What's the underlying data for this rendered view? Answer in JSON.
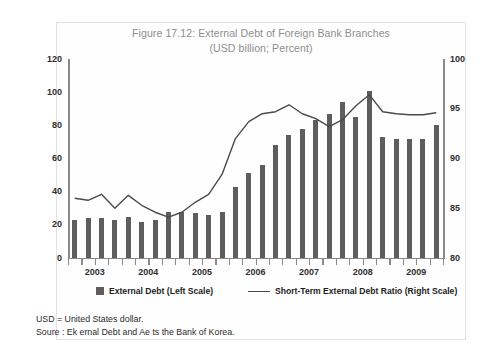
{
  "figure": {
    "title_line1": "Figure 17.12: External Debt of Foreign Bank Branches",
    "title_line2": "(USD billion; Percent)",
    "note_line1": "USD = United States dollar.",
    "note_line2": "Soure : Ek ernal Debt and Ae    ts  the Bank of Korea."
  },
  "legend": {
    "bar_label": "External Debt (Left Scale)",
    "line_label": "Short-Term External Debt Ratio (Right Scale)"
  },
  "colors": {
    "bar": "#5d5d5d",
    "line": "#4a4a4a",
    "axis": "#8a8a8a",
    "title": "#8d8d8d"
  },
  "chart_data": {
    "type": "bar",
    "title": "Figure 17.12: External Debt of Foreign Bank Branches",
    "subtitle": "(USD billion; Percent)",
    "xlabel": "",
    "ylabel": "USD billion",
    "y2label": "Percent",
    "ylim": [
      0,
      120
    ],
    "yticks": [
      0,
      20,
      40,
      60,
      80,
      100,
      120
    ],
    "y2lim": [
      80,
      100
    ],
    "y2ticks": [
      80,
      85,
      90,
      95,
      100
    ],
    "grid": false,
    "legend_position": "bottom",
    "categories": [
      "2003Q1",
      "2003Q2",
      "2003Q3",
      "2003Q4",
      "2004Q1",
      "2004Q2",
      "2004Q3",
      "2004Q4",
      "2005Q1",
      "2005Q2",
      "2005Q3",
      "2005Q4",
      "2006Q1",
      "2006Q2",
      "2006Q3",
      "2006Q4",
      "2007Q1",
      "2007Q2",
      "2007Q3",
      "2007Q4",
      "2008Q1",
      "2008Q2",
      "2008Q3",
      "2008Q4",
      "2009Q1",
      "2009Q2",
      "2009Q3",
      "2009Q4"
    ],
    "year_labels": [
      "2003",
      "2004",
      "2005",
      "2006",
      "2007",
      "2008",
      "2009"
    ],
    "series": [
      {
        "name": "External Debt (Left Scale)",
        "axis": "left",
        "type": "bar",
        "values": [
          23,
          24,
          24,
          23,
          25,
          22,
          23,
          28,
          28,
          27,
          26,
          28,
          43,
          51,
          56,
          68,
          74,
          78,
          83,
          87,
          94,
          85,
          101,
          73,
          72,
          72,
          72,
          80
        ]
      },
      {
        "name": "Short-Term External Debt Ratio (Right Scale)",
        "axis": "right",
        "type": "line",
        "values": [
          86.0,
          85.8,
          86.4,
          85.0,
          86.3,
          85.3,
          84.6,
          84.1,
          84.6,
          85.6,
          86.4,
          88.4,
          92.0,
          93.7,
          94.5,
          94.7,
          95.4,
          94.5,
          94.0,
          93.2,
          93.9,
          95.3,
          96.4,
          94.7,
          94.5,
          94.4,
          94.4,
          94.6
        ]
      }
    ]
  }
}
